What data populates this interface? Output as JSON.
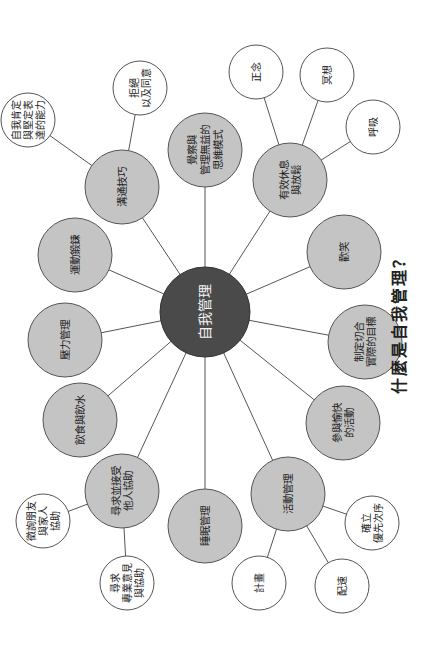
{
  "title": "什麼是自我管理？",
  "hub": {
    "label": "自我管理",
    "x": 205,
    "y": 312,
    "r": 45
  },
  "nodes": [
    {
      "id": "communication",
      "lines": [
        "溝通技巧"
      ],
      "x": 122,
      "y": 187,
      "r": 37,
      "type": "main"
    },
    {
      "id": "thought",
      "lines": [
        "覺察與",
        "管理無益的",
        "思維模式"
      ],
      "x": 205,
      "y": 150,
      "r": 37,
      "type": "main"
    },
    {
      "id": "rest",
      "lines": [
        "有效休息",
        "與放鬆"
      ],
      "x": 290,
      "y": 180,
      "r": 37,
      "type": "main"
    },
    {
      "id": "exercise",
      "lines": [
        "運動鍛鍊"
      ],
      "x": 75,
      "y": 255,
      "r": 37,
      "type": "main"
    },
    {
      "id": "laugh",
      "lines": [
        "歡笑"
      ],
      "x": 344,
      "y": 252,
      "r": 37,
      "type": "main"
    },
    {
      "id": "stress",
      "lines": [
        "壓力管理"
      ],
      "x": 65,
      "y": 340,
      "r": 37,
      "type": "main"
    },
    {
      "id": "goals",
      "lines": [
        "制定切合",
        "實際的目標"
      ],
      "x": 365,
      "y": 342,
      "r": 37,
      "type": "main"
    },
    {
      "id": "diet",
      "lines": [
        "飲食與飲水"
      ],
      "x": 80,
      "y": 420,
      "r": 37,
      "type": "main"
    },
    {
      "id": "enjoy",
      "lines": [
        "參與愉快",
        "的活動"
      ],
      "x": 343,
      "y": 423,
      "r": 37,
      "type": "main"
    },
    {
      "id": "help",
      "lines": [
        "尋求並接受",
        "他人協助"
      ],
      "x": 122,
      "y": 491,
      "r": 37,
      "type": "main"
    },
    {
      "id": "sleep",
      "lines": [
        "睡眠管理"
      ],
      "x": 205,
      "y": 526,
      "r": 37,
      "type": "main"
    },
    {
      "id": "activity",
      "lines": [
        "活動管理"
      ],
      "x": 288,
      "y": 494,
      "r": 37,
      "type": "main"
    }
  ],
  "leaves": [
    {
      "id": "assertive",
      "parent": "communication",
      "lines": [
        "自我肯定",
        "與堅定表",
        "達的能力"
      ],
      "x": 28,
      "y": 120,
      "r": 27
    },
    {
      "id": "refuse",
      "parent": "communication",
      "lines": [
        "拒絕",
        "以及同意"
      ],
      "x": 140,
      "y": 88,
      "r": 27
    },
    {
      "id": "mindful",
      "parent": "rest",
      "lines": [
        "正念"
      ],
      "x": 256,
      "y": 72,
      "r": 27
    },
    {
      "id": "meditate",
      "parent": "rest",
      "lines": [
        "冥想"
      ],
      "x": 327,
      "y": 75,
      "r": 27
    },
    {
      "id": "breath",
      "parent": "rest",
      "lines": [
        "呼吸"
      ],
      "x": 373,
      "y": 127,
      "r": 27
    },
    {
      "id": "priority",
      "parent": "activity",
      "lines": [
        "確立",
        "優先次序"
      ],
      "x": 372,
      "y": 523,
      "r": 27
    },
    {
      "id": "plan",
      "parent": "activity",
      "lines": [
        "計畫"
      ],
      "x": 259,
      "y": 583,
      "r": 27
    },
    {
      "id": "pace",
      "parent": "activity",
      "lines": [
        "配速"
      ],
      "x": 342,
      "y": 586,
      "r": 27
    },
    {
      "id": "friends",
      "parent": "help",
      "lines": [
        "徵詢朋友",
        "與家人",
        "協助"
      ],
      "x": 43,
      "y": 521,
      "r": 27
    },
    {
      "id": "pro",
      "parent": "help",
      "lines": [
        "尋求",
        "專業意見",
        "與協助"
      ],
      "x": 127,
      "y": 583,
      "r": 27
    }
  ],
  "colors": {
    "hub": "#4a4a4a",
    "main": "#c4c4c4",
    "leaf": "#ffffff",
    "line": "#555555"
  }
}
